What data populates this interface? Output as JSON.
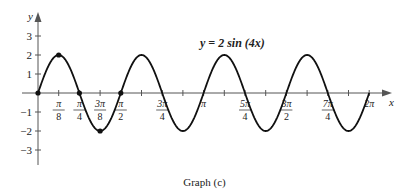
{
  "chart_data": {
    "type": "line",
    "title": "y = 2 sin (4x)",
    "xlabel": "x",
    "ylabel": "y",
    "function": "2*sin(4*x)",
    "xlim": [
      0,
      6.2832
    ],
    "ylim": [
      -3,
      3
    ],
    "grid": false,
    "x_ticks": [
      {
        "num": "π",
        "den": "8",
        "value": 0.3927
      },
      {
        "num": "π",
        "den": "4",
        "value": 0.7854
      },
      {
        "num": "3π",
        "den": "8",
        "value": 1.1781
      },
      {
        "num": "π",
        "den": "2",
        "value": 1.5708
      },
      {
        "num": "",
        "den": "",
        "value": 1.9635
      },
      {
        "num": "3π",
        "den": "4",
        "value": 2.3562
      },
      {
        "num": "",
        "den": "",
        "value": 2.7489
      },
      {
        "num": "π",
        "den": "",
        "value": 3.1416
      },
      {
        "num": "",
        "den": "",
        "value": 3.5343
      },
      {
        "num": "5π",
        "den": "4",
        "value": 3.927
      },
      {
        "num": "",
        "den": "",
        "value": 4.3197
      },
      {
        "num": "3π",
        "den": "2",
        "value": 4.7124
      },
      {
        "num": "",
        "den": "",
        "value": 5.1051
      },
      {
        "num": "7π",
        "den": "4",
        "value": 5.4978
      },
      {
        "num": "",
        "den": "",
        "value": 5.8905
      },
      {
        "num": "2π",
        "den": "",
        "value": 6.2832
      }
    ],
    "y_ticks": [
      3,
      2,
      1,
      -1,
      -2,
      -3
    ],
    "marked_points": [
      {
        "x": 0,
        "y": 0
      },
      {
        "x": 0.3927,
        "y": 2
      },
      {
        "x": 0.7854,
        "y": 0
      },
      {
        "x": 1.1781,
        "y": -2
      },
      {
        "x": 1.5708,
        "y": 0
      }
    ],
    "amplitude": 2,
    "period": "π/2",
    "caption": "Graph (c)"
  },
  "colors": {
    "curve": "#111111",
    "axis": "#555555",
    "text": "#222222"
  }
}
